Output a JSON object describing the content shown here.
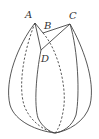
{
  "diagram": {
    "type": "geometry-solid",
    "points": {
      "A": {
        "label": "A",
        "x": 35,
        "y": 23
      },
      "B": {
        "label": "B",
        "x": 43,
        "y": 33
      },
      "C": {
        "label": "C",
        "x": 70,
        "y": 24
      },
      "D": {
        "label": "D",
        "x": 41,
        "y": 50
      },
      "bottom": {
        "x": 55,
        "y": 133
      }
    },
    "segments": [
      {
        "from": "A",
        "to": "B",
        "style": "solid"
      },
      {
        "from": "B",
        "to": "C",
        "style": "solid"
      },
      {
        "from": "A",
        "to": "D",
        "style": "solid"
      },
      {
        "from": "C",
        "to": "D",
        "style": "solid"
      }
    ],
    "colors": {
      "stroke": "#444444",
      "label": "#333333",
      "background": "#ffffff"
    }
  }
}
